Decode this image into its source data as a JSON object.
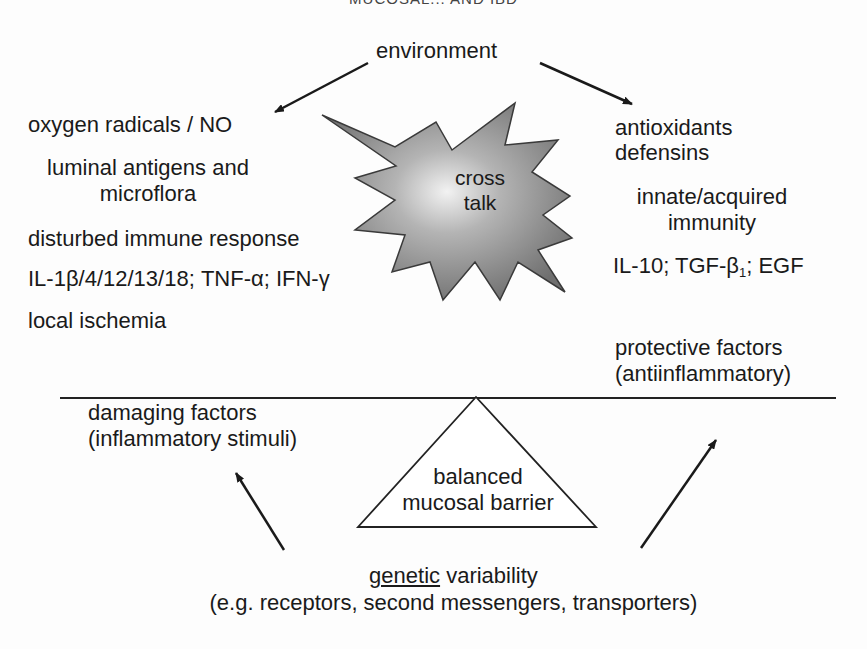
{
  "header": {
    "title": "MUCOSAL... AND IBD"
  },
  "top": {
    "environment": "environment"
  },
  "center": {
    "starburst_line1": "cross",
    "starburst_line2": "talk"
  },
  "left": {
    "items": [
      "oxygen radicals / NO",
      "luminal antigens and",
      "microflora",
      "disturbed immune response",
      "IL-1β/4/12/13/18; TNF-α; IFN-γ",
      "local ischemia"
    ],
    "summary_line1": "damaging factors",
    "summary_line2": "(inflammatory stimuli)"
  },
  "right": {
    "items": [
      "antioxidants",
      "defensins",
      "innate/acquired",
      "immunity"
    ],
    "cytokines_prefix": "IL-10; TGF-β",
    "cytokines_sub": "1",
    "cytokines_suffix": "; EGF",
    "summary_line1": "protective factors",
    "summary_line2": "(antiinflammatory)"
  },
  "fulcrum": {
    "line1": "balanced",
    "line2": "mucosal barrier"
  },
  "bottom": {
    "genetic_underlined": "genetic",
    "genetic_rest": " variability",
    "examples": "(e.g. receptors, second messengers, transporters)"
  },
  "colors": {
    "text": "#1a1a1a",
    "star_fill": "#8a8a8a",
    "line": "#222222"
  }
}
